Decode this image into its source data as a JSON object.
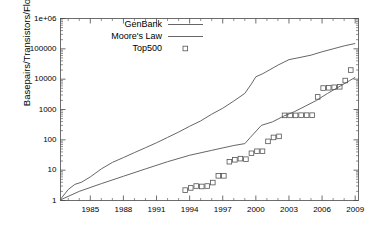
{
  "chart_data": {
    "type": "line",
    "title": "",
    "xlabel": "",
    "ylabel": "Basepairs/Transistors/Flops",
    "yscale": "log",
    "ylim": [
      1,
      1000000
    ],
    "xlim": [
      1982.3,
      2009.3
    ],
    "grid": false,
    "legend_position": "top-center",
    "ytick_labels": [
      "1",
      "10",
      "100",
      "1000",
      "10000",
      "100000",
      "1e+06"
    ],
    "ytick_values": [
      1,
      10,
      100,
      1000,
      10000,
      100000,
      1000000
    ],
    "xtick_labels": [
      "1985",
      "1988",
      "1991",
      "1994",
      "1997",
      "2000",
      "2003",
      "2006",
      "2009"
    ],
    "xtick_values": [
      1985,
      1988,
      1991,
      1994,
      1997,
      2000,
      2003,
      2006,
      2009
    ],
    "series": [
      {
        "name": "GenBank",
        "style": "line",
        "color": "#555555",
        "x": [
          1982.3,
          1983.0,
          1983.6,
          1984.2,
          1985.0,
          1986.0,
          1987.0,
          1988.0,
          1989.0,
          1990.0,
          1991.0,
          1992.0,
          1993.0,
          1994.0,
          1995.0,
          1996.0,
          1997.0,
          1998.0,
          1999.0,
          1999.6,
          2000.0,
          2000.6,
          2001.0,
          2002.0,
          2003.0,
          2004.0,
          2005.0,
          2006.0,
          2007.0,
          2008.0,
          2009.0
        ],
        "y": [
          1.1,
          2.3,
          3.4,
          4.0,
          6.0,
          11.0,
          18.0,
          26.0,
          38.0,
          55.0,
          80.0,
          120.0,
          180.0,
          280.0,
          420.0,
          700.0,
          1100.0,
          1900.0,
          3400.0,
          7000.0,
          12000.0,
          15000.0,
          18000.0,
          29000.0,
          44000.0,
          52000.0,
          62000.0,
          80000.0,
          100000.0,
          125000.0,
          150000.0
        ]
      },
      {
        "name": "Moore's Law",
        "style": "line",
        "color": "#555555",
        "x": [
          1982.3,
          1984.0,
          1986.0,
          1988.0,
          1990.0,
          1992.0,
          1994.0,
          1996.0,
          1998.0,
          1999.0,
          1999.5,
          2000.5,
          2001.5,
          2002.5,
          2003.5,
          2004.5,
          2005.5,
          2006.5,
          2007.5,
          2008.5,
          2009.0
        ],
        "y": [
          1.05,
          2.0,
          3.6,
          6.3,
          11.0,
          19.0,
          31.0,
          45.0,
          65.0,
          75.0,
          120.0,
          300.0,
          390.0,
          600.0,
          850.0,
          1300.0,
          2000.0,
          3400.0,
          5500.0,
          9000.0,
          11500.0
        ]
      },
      {
        "name": "Top500",
        "style": "points",
        "marker": "square",
        "color": "#555555",
        "x": [
          1993.6,
          1994.1,
          1994.6,
          1995.1,
          1995.6,
          1996.1,
          1996.6,
          1997.1,
          1997.6,
          1998.1,
          1998.6,
          1999.1,
          1999.6,
          2000.1,
          2000.6,
          2001.1,
          2001.6,
          2002.1,
          2002.6,
          2003.1,
          2003.6,
          2004.1,
          2004.6,
          2005.1,
          2005.6,
          2006.1,
          2006.6,
          2007.1,
          2007.6,
          2008.1,
          2008.6
        ],
        "y": [
          2.2,
          2.6,
          3.0,
          2.9,
          3.0,
          3.9,
          6.5,
          6.5,
          19.0,
          22.0,
          24.0,
          23.0,
          36.0,
          42.0,
          42.0,
          89.0,
          120.0,
          130.0,
          640.0,
          640.0,
          640.0,
          650.0,
          650.0,
          650.0,
          2600.0,
          5100.0,
          5200.0,
          5400.0,
          5600.0,
          9000.0,
          20000.0
        ]
      }
    ]
  },
  "legend": {
    "entries": [
      {
        "label": "GenBank",
        "type": "line"
      },
      {
        "label": "Moore's Law",
        "type": "line"
      },
      {
        "label": "Top500",
        "type": "square-marker"
      }
    ]
  }
}
